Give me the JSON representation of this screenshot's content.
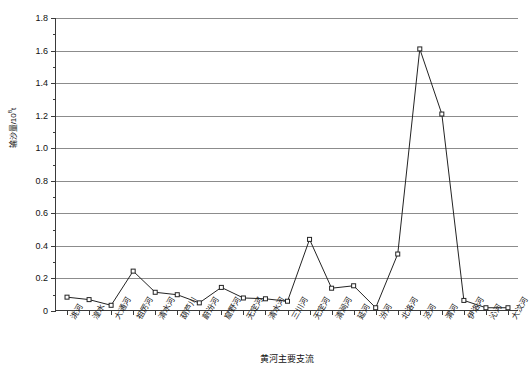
{
  "chart_data": {
    "type": "line",
    "title": "",
    "xlabel": "黄河主要支流",
    "ylabel": "输沙量/10",
    "ylabel_sup": "8",
    "ylabel_unit": "t",
    "ylim": [
      0,
      1.8
    ],
    "ytick_step": 0.2,
    "yticks": [
      "0",
      "0.2",
      "0.4",
      "0.6",
      "0.8",
      "1.0",
      "1.2",
      "1.4",
      "1.6",
      "1.8"
    ],
    "ytick_values": [
      0,
      0.2,
      0.4,
      0.6,
      0.8,
      1.0,
      1.2,
      1.4,
      1.6,
      1.8
    ],
    "grid": true,
    "grid_axis": "y",
    "legend": "none",
    "marker": "open-square",
    "line_color": "#232323",
    "grid_color": "#8c8c8c",
    "categories": [
      "洮河",
      "湟水",
      "大通河",
      "祖厉河",
      "清水河",
      "葫芦川",
      "蔚汾河",
      "窟野河",
      "无定河",
      "清水河",
      "三川河",
      "无定河",
      "清涧河",
      "延河",
      "汾河",
      "北洛河",
      "泾河",
      "渭河",
      "伊洛河",
      "沁河",
      "大汶河"
    ],
    "values": [
      0.085,
      0.07,
      0.035,
      0.245,
      0.115,
      0.1,
      0.05,
      0.145,
      0.08,
      0.075,
      0.06,
      0.44,
      0.14,
      0.155,
      0.02,
      0.35,
      1.61,
      1.21,
      0.065,
      0.02,
      0.02
    ],
    "point_count": 21
  },
  "axis": {
    "x_title": "黄河主要支流",
    "y_title_main": "输沙量/10",
    "y_title_exp": "8",
    "y_title_tail": "t"
  }
}
